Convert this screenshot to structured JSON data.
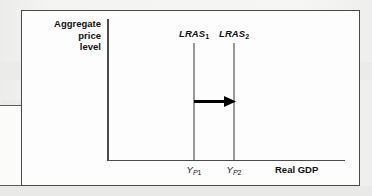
{
  "figure": {
    "y_axis_title_lines": [
      "Aggregate",
      "price",
      "level"
    ],
    "x_axis_title": "Real GDP",
    "curves": [
      {
        "name": "LRAS1",
        "base_label": "LRAS",
        "subscript": "1"
      },
      {
        "name": "LRAS2",
        "base_label": "LRAS",
        "subscript": "2"
      }
    ],
    "x_tick_labels": [
      {
        "name": "YP1",
        "base_label": "Y",
        "sub_letter": "P",
        "sub_number": "1"
      },
      {
        "name": "YP2",
        "base_label": "Y",
        "sub_letter": "P",
        "sub_number": "2"
      }
    ],
    "annotation": {
      "arrow_name": "rightward-shift-arrow",
      "arrow_direction": "right"
    },
    "colors": {
      "frame_border": "#4a4a4a",
      "axis_line": "#4d4d4d",
      "curve_line": "#9a9a9a",
      "arrow": "#000000",
      "plot_background": "#fdfdfd",
      "page_background": "#f2f2f1",
      "text": "#111111"
    }
  },
  "background_bleed": {
    "lines": [
      "Short-Run M",
      "e prod",
      "ong-run",
      "lion"
    ]
  }
}
